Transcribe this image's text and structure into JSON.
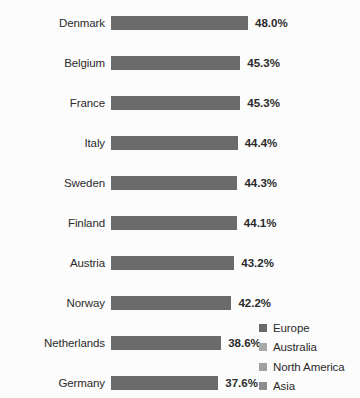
{
  "chart_data": {
    "type": "bar",
    "orientation": "horizontal",
    "title": "",
    "xlabel": "",
    "ylabel": "",
    "grid": false,
    "axis_visible": false,
    "xlim": [
      0,
      48.0
    ],
    "value_suffix": "%",
    "legend_position": "bottom-right",
    "categories": [
      "Denmark",
      "Belgium",
      "France",
      "Italy",
      "Sweden",
      "Finland",
      "Austria",
      "Norway",
      "Netherlands",
      "Germany",
      "United Kingdom",
      "Greece",
      "Spain",
      "New Zealand",
      "Portugal",
      "Canada",
      "Japan",
      "Australia",
      "United States"
    ],
    "values": [
      48.0,
      45.3,
      45.3,
      44.4,
      44.3,
      44.1,
      43.2,
      42.2,
      38.6,
      37.6,
      35.2,
      33.8,
      32.9,
      32.9,
      32.5,
      30.7,
      28.6,
      26.5,
      24.3
    ],
    "value_labels": [
      "48.0%",
      "45.3%",
      "45.3%",
      "44.4%",
      "44.3%",
      "44.1%",
      "43.2%",
      "42.2%",
      "38.6%",
      "37.6%",
      "35.2%",
      "33.8%",
      "32.9%",
      "32.9%",
      "32.5%",
      "30.7%",
      "28.6%",
      "26.5%",
      "24.3%"
    ],
    "groups": [
      "Europe",
      "Europe",
      "Europe",
      "Europe",
      "Europe",
      "Europe",
      "Europe",
      "Europe",
      "Europe",
      "Europe",
      "Europe",
      "Europe",
      "Europe",
      "Australia",
      "Europe",
      "North America",
      "Asia",
      "Australia",
      "North America"
    ],
    "legend": [
      {
        "label": "Europe",
        "color": "#6b6b6b"
      },
      {
        "label": "Australia",
        "color": "#a8a8a8"
      },
      {
        "label": "North America",
        "color": "#a0a0a0"
      },
      {
        "label": "Asia",
        "color": "#8d8d8d"
      }
    ],
    "group_colors": {
      "Europe": "#6b6b6b",
      "Australia": "#a8a8a8",
      "North America": "#a0a0a0",
      "Asia": "#8d8d8d"
    }
  }
}
